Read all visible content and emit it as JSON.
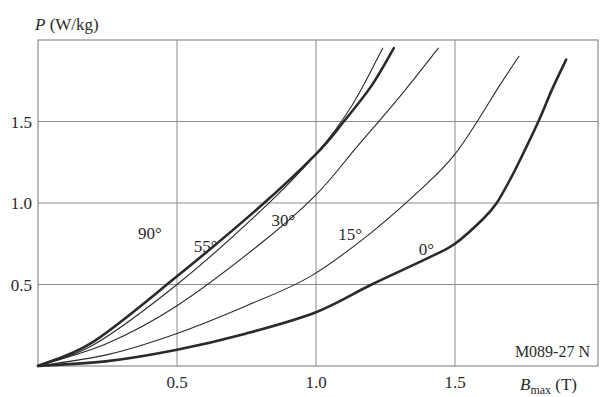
{
  "chart_data": {
    "type": "line",
    "title": "",
    "xlabel": "B_max (T)",
    "xlabel_main": "B",
    "xlabel_sub": "max",
    "xlabel_unit": " (T)",
    "ylabel": "P (W/kg)",
    "ylabel_main": "P",
    "ylabel_unit": " (W/kg)",
    "xlim": [
      0,
      2.0
    ],
    "ylim": [
      0,
      1.95
    ],
    "x_ticks": [
      0.5,
      1.0,
      1.5
    ],
    "x_tick_labels": [
      "0.5",
      "1.0",
      "1.5"
    ],
    "y_ticks": [
      0.5,
      1.0,
      1.5
    ],
    "y_tick_labels": [
      "0.5",
      "1.0",
      "1.5"
    ],
    "grid": true,
    "annotation": "M089-27 N",
    "series": [
      {
        "name": "0°",
        "bold": true,
        "label_pos": [
          1.37,
          0.68
        ],
        "points": [
          [
            0,
            0
          ],
          [
            0.25,
            0.03
          ],
          [
            0.5,
            0.1
          ],
          [
            0.75,
            0.2
          ],
          [
            1.0,
            0.33
          ],
          [
            1.2,
            0.5
          ],
          [
            1.4,
            0.66
          ],
          [
            1.5,
            0.75
          ],
          [
            1.6,
            0.9
          ],
          [
            1.65,
            1.0
          ],
          [
            1.7,
            1.15
          ],
          [
            1.73,
            1.25
          ],
          [
            1.8,
            1.5
          ],
          [
            1.85,
            1.7
          ],
          [
            1.9,
            1.88
          ]
        ]
      },
      {
        "name": "15°",
        "bold": false,
        "label_pos": [
          1.08,
          0.77
        ],
        "points": [
          [
            0,
            0
          ],
          [
            0.25,
            0.07
          ],
          [
            0.5,
            0.2
          ],
          [
            0.75,
            0.37
          ],
          [
            0.98,
            0.55
          ],
          [
            1.2,
            0.82
          ],
          [
            1.4,
            1.12
          ],
          [
            1.5,
            1.3
          ],
          [
            1.58,
            1.5
          ],
          [
            1.66,
            1.72
          ],
          [
            1.73,
            1.9
          ]
        ]
      },
      {
        "name": "30°",
        "bold": false,
        "label_pos": [
          0.84,
          0.86
        ],
        "points": [
          [
            0,
            0
          ],
          [
            0.25,
            0.14
          ],
          [
            0.5,
            0.37
          ],
          [
            0.8,
            0.75
          ],
          [
            1.0,
            1.05
          ],
          [
            1.15,
            1.35
          ],
          [
            1.3,
            1.65
          ],
          [
            1.44,
            1.95
          ]
        ]
      },
      {
        "name": "55°",
        "bold": false,
        "label_pos": [
          0.56,
          0.7
        ],
        "points": [
          [
            0,
            0
          ],
          [
            0.2,
            0.13
          ],
          [
            0.5,
            0.5
          ],
          [
            0.8,
            0.95
          ],
          [
            1.0,
            1.3
          ],
          [
            1.13,
            1.6
          ],
          [
            1.24,
            1.95
          ]
        ]
      },
      {
        "name": "90°",
        "bold": true,
        "label_pos": [
          0.36,
          0.78
        ],
        "points": [
          [
            0,
            0
          ],
          [
            0.2,
            0.15
          ],
          [
            0.5,
            0.55
          ],
          [
            0.8,
            0.98
          ],
          [
            1.0,
            1.3
          ],
          [
            1.1,
            1.5
          ],
          [
            1.2,
            1.72
          ],
          [
            1.28,
            1.95
          ]
        ]
      }
    ]
  },
  "style": {
    "grid_color": "#8c8c8c",
    "line_color": "#2a2a2a",
    "text_color": "#2a2a2a"
  }
}
